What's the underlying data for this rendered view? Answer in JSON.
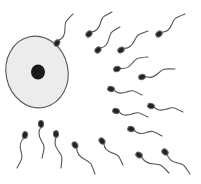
{
  "illustration": {
    "subject": "egg cell surrounded by sperm cells",
    "colors": {
      "background": "#ffffff",
      "egg_fill": "#ececec",
      "egg_outline": "#555555",
      "nucleus": "#1a1a1a",
      "sperm_head": "#222222",
      "sperm_tail": "#555555"
    },
    "egg": {
      "cx": 37,
      "cy": 72,
      "rx": 31,
      "ry": 36
    },
    "nucleus": {
      "cx": 38,
      "cy": 72,
      "rx": 7,
      "ry": 7.5
    },
    "sperm": [
      {
        "head": [
          57,
          43
        ],
        "tail": [
          73,
          14
        ]
      },
      {
        "head": [
          89,
          34
        ],
        "tail": [
          112,
          12
        ]
      },
      {
        "head": [
          98,
          50
        ],
        "tail": [
          120,
          27
        ]
      },
      {
        "head": [
          121,
          50
        ],
        "tail": [
          148,
          31
        ]
      },
      {
        "head": [
          159,
          34
        ],
        "tail": [
          185,
          14
        ]
      },
      {
        "head": [
          117,
          69
        ],
        "tail": [
          148,
          57
        ]
      },
      {
        "head": [
          142,
          77
        ],
        "tail": [
          175,
          69
        ]
      },
      {
        "head": [
          111,
          89
        ],
        "tail": [
          142,
          95
        ]
      },
      {
        "head": [
          116,
          111
        ],
        "tail": [
          148,
          117
        ]
      },
      {
        "head": [
          151,
          106
        ],
        "tail": [
          183,
          112
        ]
      },
      {
        "head": [
          131,
          129
        ],
        "tail": [
          162,
          136
        ]
      },
      {
        "head": [
          165,
          152
        ],
        "tail": [
          190,
          174
        ]
      },
      {
        "head": [
          102,
          141
        ],
        "tail": [
          123,
          165
        ]
      },
      {
        "head": [
          139,
          155
        ],
        "tail": [
          169,
          173
        ]
      },
      {
        "head": [
          25,
          135
        ],
        "tail": [
          17,
          168
        ]
      },
      {
        "head": [
          41,
          124
        ],
        "tail": [
          42,
          158
        ]
      },
      {
        "head": [
          56,
          134
        ],
        "tail": [
          61,
          168
        ]
      },
      {
        "head": [
          75,
          145
        ],
        "tail": [
          95,
          174
        ]
      }
    ]
  }
}
